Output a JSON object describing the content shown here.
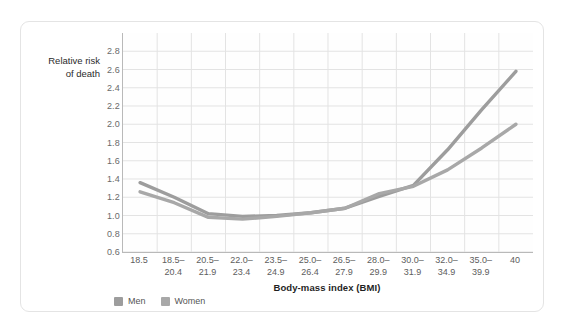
{
  "chart_data": {
    "type": "line",
    "title": "",
    "subtitle": "",
    "xlabel": "Body-mass index (BMI)",
    "ylabel": "Relative risk of death",
    "ylabel_lines": [
      "Relative risk",
      "of death"
    ],
    "categories": [
      "18.5",
      "18.5–20.4",
      "20.5–21.9",
      "22.0–23.4",
      "23.5–24.9",
      "25.0–26.4",
      "26.5–27.9",
      "28.0–29.9",
      "30.0–31.9",
      "32.0–34.9",
      "35.0–39.9",
      "40"
    ],
    "category_lines": [
      [
        "18.5",
        ""
      ],
      [
        "18.5–",
        "20.4"
      ],
      [
        "20.5–",
        "21.9"
      ],
      [
        "22.0–",
        "23.4"
      ],
      [
        "23.5–",
        "24.9"
      ],
      [
        "25.0–",
        "26.4"
      ],
      [
        "26.5–",
        "27.9"
      ],
      [
        "28.0–",
        "29.9"
      ],
      [
        "30.0–",
        "31.9"
      ],
      [
        "32.0–",
        "34.9"
      ],
      [
        "35.0–",
        "39.9"
      ],
      [
        "40",
        ""
      ]
    ],
    "series": [
      {
        "name": "Men",
        "color": "#9d9d9d",
        "values": [
          1.36,
          1.2,
          1.02,
          0.99,
          1.0,
          1.03,
          1.08,
          1.21,
          1.33,
          1.72,
          2.16,
          2.58
        ]
      },
      {
        "name": "Women",
        "color": "#a8a8a8",
        "values": [
          1.26,
          1.14,
          0.98,
          0.96,
          0.99,
          1.03,
          1.08,
          1.24,
          1.32,
          1.5,
          1.74,
          2.0
        ]
      }
    ],
    "ylim": [
      0.6,
      3.0
    ],
    "yticks": [
      "2.8",
      "2.6",
      "2.4",
      "2.2",
      "2.0",
      "1.8",
      "1.6",
      "1.4",
      "1.2",
      "1.0",
      "0.8",
      "0.6"
    ],
    "ytick_values": [
      2.8,
      2.6,
      2.4,
      2.2,
      2.0,
      1.8,
      1.6,
      1.4,
      1.2,
      1.0,
      0.8,
      0.6
    ],
    "grid": true,
    "legend_position": "bottom-left"
  },
  "legend": {
    "items": [
      {
        "label": "Men",
        "color": "#9d9d9d"
      },
      {
        "label": "Women",
        "color": "#a8a8a8"
      }
    ]
  },
  "colors": {
    "card_border": "#e4e4e4",
    "grid": "#e3e3e3",
    "axis": "#b9b9b9",
    "tick_text": "#6a6a6a",
    "title_text": "#1f1f1f"
  }
}
